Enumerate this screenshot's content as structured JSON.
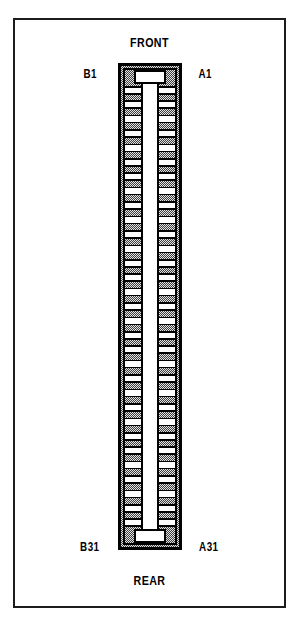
{
  "figure": {
    "width": 299,
    "height": 623
  },
  "colors": {
    "ink": "#1c1c1c",
    "outline": "#000000",
    "body_fill_stipple_dark": "#4a4a4a",
    "body_fill_stipple_light": "#d8d8d8",
    "channel": "#ffffff",
    "page": "#ffffff"
  },
  "labels": {
    "front": "FRONT",
    "rear": "REAR",
    "top_left_pin": "B1",
    "top_right_pin": "A1",
    "bottom_left_pin": "B31",
    "bottom_right_pin": "A31"
  },
  "connector": {
    "type": "two-row-edge-connector",
    "rows": [
      "B",
      "A"
    ],
    "row_b_side": "left",
    "row_a_side": "right",
    "first_pin": 1,
    "last_pin": 31,
    "pin_count_per_row": 31,
    "total_pins": 62,
    "orientation": {
      "top": "FRONT",
      "bottom": "REAR"
    },
    "geometry": {
      "body_x": 118,
      "body_y": 63,
      "body_width": 64,
      "body_height": 487,
      "border_thickness": 4,
      "channel_width": 16,
      "tooth_pitch": 15.2,
      "tooth_length": 18,
      "tooth_thickness": 7,
      "key_notch_width": 30,
      "key_notch_depth": 12
    }
  }
}
